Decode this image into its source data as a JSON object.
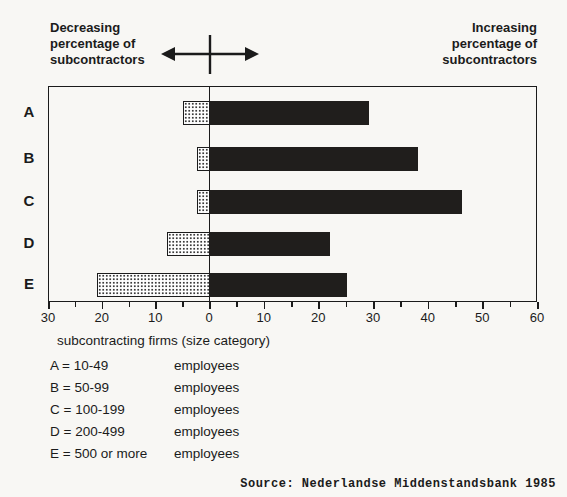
{
  "colors": {
    "paper": "#f8f7f4",
    "ink": "#1b1b1b",
    "bar_dark": "#201e1c",
    "bar_dot_bg": "#ffffff",
    "bar_dot": "#3a3a3a"
  },
  "header": {
    "left_label": "Decreasing\npercentage of\nsubcontractors",
    "right_label": "Increasing\npercentage of\nsubcontractors"
  },
  "chart_data": {
    "type": "bar",
    "orientation": "horizontal-diverging",
    "categories": [
      "A",
      "B",
      "C",
      "D",
      "E"
    ],
    "series": [
      {
        "name": "Decreasing percentage of subcontractors",
        "side": "left",
        "style": "dotted",
        "values": [
          5,
          2.5,
          2.5,
          8,
          21
        ]
      },
      {
        "name": "Increasing percentage of subcontractors",
        "side": "right",
        "style": "solid-dark",
        "values": [
          29,
          38,
          46,
          22,
          25
        ]
      }
    ],
    "axis": {
      "left_max": 30,
      "right_max": 60,
      "major_step": 10,
      "minor_step": 5,
      "tick_labels": [
        "30",
        "20",
        "10",
        "0",
        "10",
        "20",
        "30",
        "40",
        "50",
        "60"
      ]
    },
    "caption": "subcontracting firms (size category)",
    "grid": false,
    "legend_position": "below"
  },
  "legend": {
    "caption": "subcontracting firms (size category)",
    "entries": [
      {
        "label": "A = 10-49",
        "unit": "employees"
      },
      {
        "label": "B = 50-99",
        "unit": "employees"
      },
      {
        "label": "C = 100-199",
        "unit": "employees"
      },
      {
        "label": "D = 200-499",
        "unit": "employees"
      },
      {
        "label": "E = 500 or more",
        "unit": "employees"
      }
    ]
  },
  "source": "Source: Nederlandse Middenstandsbank 1985"
}
